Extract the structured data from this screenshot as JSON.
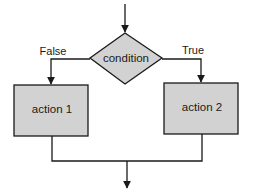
{
  "diagram": {
    "type": "flowchart-if-else",
    "colors": {
      "line": "#1a1a1a",
      "node_fill": "#d2d2d2",
      "background": "#ffffff"
    },
    "decision": {
      "label": "condition"
    },
    "branches": {
      "false_label": "False",
      "true_label": "True"
    },
    "actions": [
      {
        "label": "action 1",
        "branch": "False"
      },
      {
        "label": "action 2",
        "branch": "True"
      }
    ]
  }
}
